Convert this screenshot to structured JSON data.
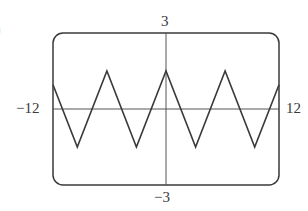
{
  "chart_data": {
    "type": "line",
    "title": "",
    "part_label": ")",
    "xlabel": "",
    "ylabel": "",
    "xlim": [
      -12,
      12
    ],
    "ylim": [
      -3,
      3
    ],
    "grid": false,
    "legend": null,
    "tick_labels": {
      "x_min": "−12",
      "x_max": "12",
      "y_max": "3",
      "y_min": "−3"
    },
    "series": [
      {
        "name": "triangle wave",
        "x": [
          -12,
          -9.42,
          -6.28,
          -3.14,
          0,
          3.14,
          6.28,
          9.42,
          12
        ],
        "y": [
          0.96,
          -1.5,
          1.5,
          -1.5,
          1.5,
          -1.5,
          1.5,
          -1.5,
          0.96
        ]
      }
    ],
    "line_color": "#3a3a3a",
    "frame_color": "#3a3a3a",
    "frame_style": "rounded-rectangle viewing window"
  }
}
